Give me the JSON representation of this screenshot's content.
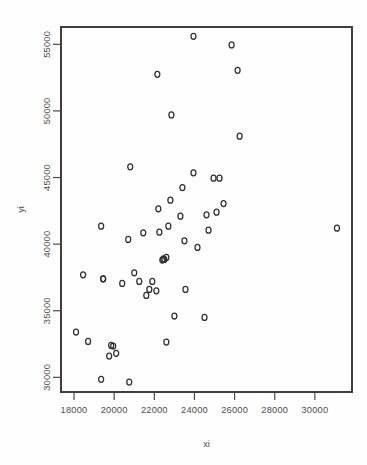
{
  "figure": {
    "background": "#fefefe",
    "point_color": "#2e2e2e",
    "axis_color": "#3f3f3f",
    "plot_box": {
      "left": 61,
      "right": 352,
      "top": 27,
      "bottom": 392
    }
  },
  "chart_data": {
    "type": "scatter",
    "title": "",
    "xlabel": "xi",
    "ylabel": "yi",
    "xlim": [
      17350,
      31850
    ],
    "ylim": [
      28900,
      56300
    ],
    "grid": false,
    "legend": null,
    "marker": "open-circle",
    "xticks": [
      18000,
      20000,
      22000,
      24000,
      26000,
      28000,
      30000
    ],
    "xticklabels": [
      "18000",
      "20000",
      "22000",
      "24000",
      "26000",
      "28000",
      "30000"
    ],
    "yticks": [
      30000,
      35000,
      40000,
      45000,
      50000,
      55000
    ],
    "yticklabels": [
      "30000",
      "35000",
      "40000",
      "45000",
      "50000",
      "55000"
    ],
    "n_points": 52,
    "x": [
      23950,
      25850,
      22150,
      26150,
      22850,
      26250,
      20800,
      24950,
      19350,
      23950,
      25250,
      23400,
      22800,
      25450,
      24600,
      22200,
      23300,
      25100,
      22700,
      24700,
      19450,
      22250,
      23500,
      21450,
      20700,
      22600,
      22500,
      21000,
      24150,
      20400,
      19450,
      21900,
      22450,
      22400,
      21250,
      21750,
      22100,
      23550,
      21600,
      23000,
      18450,
      24500,
      18100,
      18700,
      19850,
      19950,
      20100,
      19750,
      19350,
      20750,
      22600,
      31100
    ],
    "y": [
      55600,
      54950,
      52750,
      53050,
      49700,
      48100,
      45800,
      44950,
      41350,
      45350,
      44950,
      44250,
      43300,
      43050,
      42200,
      42650,
      42100,
      42400,
      41350,
      41050,
      37400,
      40900,
      40250,
      40850,
      40350,
      39000,
      38850,
      37850,
      39750,
      37050,
      37400,
      37200,
      38900,
      38800,
      37200,
      36600,
      36500,
      36600,
      36150,
      34600,
      37700,
      34500,
      33400,
      32700,
      32400,
      32350,
      31800,
      31600,
      29850,
      29650,
      32650,
      41200
    ],
    "points": [
      {
        "x": 23950,
        "y": 55600
      },
      {
        "x": 25850,
        "y": 54950
      },
      {
        "x": 22150,
        "y": 52750
      },
      {
        "x": 26150,
        "y": 53050
      },
      {
        "x": 22850,
        "y": 49700
      },
      {
        "x": 26250,
        "y": 48100
      },
      {
        "x": 20800,
        "y": 45800
      },
      {
        "x": 24950,
        "y": 44950
      },
      {
        "x": 19350,
        "y": 41350
      },
      {
        "x": 23950,
        "y": 45350
      },
      {
        "x": 25250,
        "y": 44950
      },
      {
        "x": 23400,
        "y": 44250
      },
      {
        "x": 22800,
        "y": 43300
      },
      {
        "x": 25450,
        "y": 43050
      },
      {
        "x": 24600,
        "y": 42200
      },
      {
        "x": 22200,
        "y": 42650
      },
      {
        "x": 23300,
        "y": 42100
      },
      {
        "x": 25100,
        "y": 42400
      },
      {
        "x": 22700,
        "y": 41350
      },
      {
        "x": 24700,
        "y": 41050
      },
      {
        "x": 19450,
        "y": 37400
      },
      {
        "x": 22250,
        "y": 40900
      },
      {
        "x": 23500,
        "y": 40250
      },
      {
        "x": 21450,
        "y": 40850
      },
      {
        "x": 20700,
        "y": 40350
      },
      {
        "x": 22600,
        "y": 39000
      },
      {
        "x": 22500,
        "y": 38850
      },
      {
        "x": 21000,
        "y": 37850
      },
      {
        "x": 24150,
        "y": 39750
      },
      {
        "x": 20400,
        "y": 37050
      },
      {
        "x": 19450,
        "y": 37400
      },
      {
        "x": 21900,
        "y": 37200
      },
      {
        "x": 22450,
        "y": 38900
      },
      {
        "x": 22400,
        "y": 38800
      },
      {
        "x": 21250,
        "y": 37200
      },
      {
        "x": 21750,
        "y": 36600
      },
      {
        "x": 22100,
        "y": 36500
      },
      {
        "x": 23550,
        "y": 36600
      },
      {
        "x": 21600,
        "y": 36150
      },
      {
        "x": 23000,
        "y": 34600
      },
      {
        "x": 18450,
        "y": 37700
      },
      {
        "x": 24500,
        "y": 34500
      },
      {
        "x": 18100,
        "y": 33400
      },
      {
        "x": 18700,
        "y": 32700
      },
      {
        "x": 19850,
        "y": 32400
      },
      {
        "x": 19950,
        "y": 32350
      },
      {
        "x": 20100,
        "y": 31800
      },
      {
        "x": 19750,
        "y": 31600
      },
      {
        "x": 19350,
        "y": 29850
      },
      {
        "x": 20750,
        "y": 29650
      },
      {
        "x": 22600,
        "y": 32650
      },
      {
        "x": 31100,
        "y": 41200
      }
    ]
  }
}
